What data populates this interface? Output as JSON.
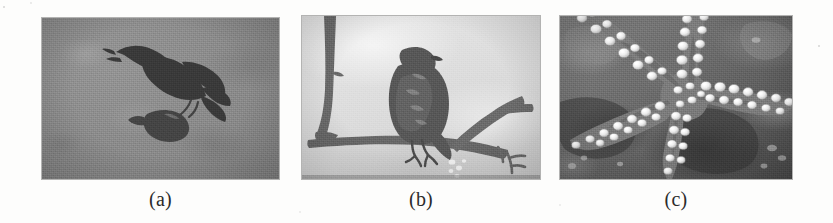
{
  "figure": {
    "kind": "scanned-grayscale-photo-figure",
    "panel_count": 3,
    "page_background": "#fdfdfc",
    "panels": [
      {
        "id": "a",
        "label": "(a)",
        "subject": "bird of prey in flight carrying a captured fish",
        "scene": "uniform mid-gray sky background with heavy film grain",
        "dominant_color": "#8b8a87",
        "subject_color": "#3d3c3a",
        "x": 42,
        "y": 18,
        "width": 237,
        "height": 161
      },
      {
        "id": "b",
        "label": "(b)",
        "subject": "raptor perched on a bare tree branch",
        "scene": "bright overcast sky with crossing bare branches",
        "dominant_color": "#dcdbd8",
        "subject_color": "#5e5c58",
        "x": 302,
        "y": 16,
        "width": 238,
        "height": 163
      },
      {
        "id": "c",
        "label": "(c)",
        "subject": "starfish with white tubercles on its arms",
        "scene": "dark rocky seabed underwater",
        "dominant_color": "#62615d",
        "subject_color": "#e9e7e0",
        "x": 560,
        "y": 16,
        "width": 232,
        "height": 163
      }
    ]
  },
  "captions": {
    "a": "(a)",
    "b": "(b)",
    "c": "(c)"
  }
}
